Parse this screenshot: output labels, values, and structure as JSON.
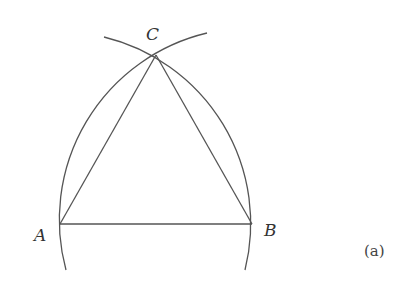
{
  "diagram": {
    "points": {
      "A": {
        "label": "A",
        "x": 60,
        "y": 224
      },
      "B": {
        "label": "B",
        "x": 252,
        "y": 224
      },
      "C": {
        "label": "C",
        "x": 156,
        "y": 55
      }
    },
    "segments": [
      [
        "A",
        "B"
      ],
      [
        "B",
        "C"
      ],
      [
        "C",
        "A"
      ]
    ],
    "arcs": [
      {
        "center": "A",
        "radius": 192,
        "through": [
          "B",
          "C"
        ]
      },
      {
        "center": "B",
        "radius": 192,
        "through": [
          "A",
          "C"
        ]
      }
    ],
    "caption": "(a)",
    "colors": {
      "stroke": "#555555",
      "text": "#333333"
    }
  }
}
